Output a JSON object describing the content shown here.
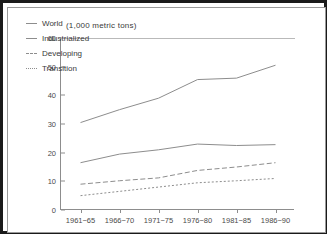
{
  "chart_data": {
    "type": "line",
    "title": "(1,000 metric tons)",
    "xlabel": "",
    "ylabel": "",
    "categories": [
      "1961−65",
      "1966−70",
      "1971−75",
      "1976−80",
      "1981−85",
      "1986−90"
    ],
    "ytick_labels": [
      "0",
      "10",
      "20",
      "30",
      "40",
      "50",
      "60"
    ],
    "ytick_values": [
      0,
      10,
      20,
      30,
      40,
      50,
      60
    ],
    "ylim": [
      0,
      60
    ],
    "grid": false,
    "legend_position": "top-left-inside",
    "series": [
      {
        "name": "World",
        "style": "solid",
        "color": "#8d8d8d",
        "values": [
          30.5,
          35.0,
          39.0,
          45.5,
          46.0,
          50.5
        ]
      },
      {
        "name": "Industrialized",
        "style": "solid",
        "color": "#8d8d8d",
        "values": [
          16.5,
          19.5,
          21.0,
          23.0,
          22.5,
          22.8
        ]
      },
      {
        "name": "Developing",
        "style": "dashed",
        "color": "#8d8d8d",
        "values": [
          9.0,
          10.2,
          11.2,
          13.8,
          15.0,
          16.5
        ]
      },
      {
        "name": "Transition",
        "style": "dotted",
        "color": "#8d8d8d",
        "values": [
          5.0,
          6.5,
          8.0,
          9.5,
          10.2,
          11.0
        ]
      }
    ]
  },
  "figure": {
    "border_color": "#1a1a1a",
    "inner_border_color": "#9a9a9a",
    "axis_color": "#8d8d8d",
    "background": "#ffffff"
  }
}
